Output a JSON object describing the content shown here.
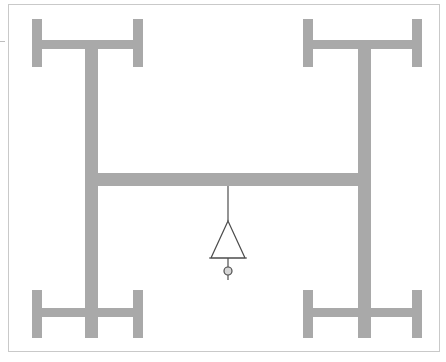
{
  "figure": {
    "canvas": {
      "width": 446,
      "height": 362
    },
    "background_color": "#ffffff",
    "member_color": "#a9a9a9",
    "line_color": "#555555",
    "border_color": "#c9c9c9"
  },
  "border": {
    "name": "drawing-frame",
    "x": 8,
    "y": 4,
    "width": 432,
    "height": 348,
    "stroke": "#c9c9c9",
    "stroke_width": 1
  },
  "left_edge_tick": {
    "name": "left-edge-tick",
    "x1": 0,
    "y1": 41,
    "x2": 5,
    "y2": 41,
    "stroke": "#bdbdbd",
    "stroke_width": 1
  },
  "members": [
    {
      "name": "top-left-flange-left",
      "type": "vertical-flange",
      "x": 32,
      "y": 19,
      "width": 10,
      "height": 48
    },
    {
      "name": "top-left-flange-right",
      "type": "vertical-flange",
      "x": 133,
      "y": 19,
      "width": 10,
      "height": 48
    },
    {
      "name": "top-left-web-beam",
      "type": "horizontal-web",
      "x": 32,
      "y": 40,
      "width": 111,
      "height": 9
    },
    {
      "name": "left-column",
      "type": "vertical-column",
      "x": 85,
      "y": 40,
      "width": 13,
      "height": 146
    },
    {
      "name": "top-right-flange-left",
      "type": "vertical-flange",
      "x": 303,
      "y": 19,
      "width": 10,
      "height": 48
    },
    {
      "name": "top-right-flange-right",
      "type": "vertical-flange",
      "x": 412,
      "y": 19,
      "width": 10,
      "height": 48
    },
    {
      "name": "top-right-web-beam",
      "type": "horizontal-web",
      "x": 303,
      "y": 40,
      "width": 119,
      "height": 9
    },
    {
      "name": "right-column",
      "type": "vertical-column",
      "x": 358,
      "y": 40,
      "width": 13,
      "height": 146
    },
    {
      "name": "main-girder",
      "type": "horizontal-girder",
      "x": 85,
      "y": 173,
      "width": 286,
      "height": 13
    },
    {
      "name": "bottom-left-column",
      "type": "vertical-column",
      "x": 85,
      "y": 186,
      "width": 13,
      "height": 152
    },
    {
      "name": "bottom-right-column",
      "type": "vertical-column",
      "x": 358,
      "y": 186,
      "width": 13,
      "height": 152
    },
    {
      "name": "bottom-left-flange-left",
      "type": "vertical-flange",
      "x": 32,
      "y": 290,
      "width": 10,
      "height": 48
    },
    {
      "name": "bottom-left-flange-right",
      "type": "vertical-flange",
      "x": 133,
      "y": 290,
      "width": 10,
      "height": 48
    },
    {
      "name": "bottom-left-web-beam",
      "type": "horizontal-web",
      "x": 32,
      "y": 308,
      "width": 111,
      "height": 9
    },
    {
      "name": "bottom-right-flange-left",
      "type": "vertical-flange",
      "x": 303,
      "y": 290,
      "width": 10,
      "height": 48
    },
    {
      "name": "bottom-right-flange-right",
      "type": "vertical-flange",
      "x": 412,
      "y": 290,
      "width": 10,
      "height": 48
    },
    {
      "name": "bottom-right-web-beam",
      "type": "horizontal-web",
      "x": 303,
      "y": 308,
      "width": 119,
      "height": 9
    }
  ],
  "support_symbol": {
    "name": "pin-support-symbol",
    "drop_line": {
      "x1": 228,
      "y1": 186,
      "x2": 228,
      "y2": 221
    },
    "triangle": {
      "apex_x": 228,
      "apex_y": 221,
      "base_left_x": 211,
      "base_right_x": 245,
      "base_y": 258
    },
    "base_line": {
      "x1": 209,
      "y1": 258,
      "x2": 247,
      "y2": 258
    },
    "stem_line": {
      "x1": 228,
      "y1": 258,
      "x2": 228,
      "y2": 267
    },
    "node_circle": {
      "cx": 228,
      "cy": 271,
      "r": 4
    },
    "tail_line": {
      "x1": 228,
      "y1": 275,
      "x2": 228,
      "y2": 280
    },
    "stroke": "#4d4d4d",
    "stroke_width": 1.2
  }
}
